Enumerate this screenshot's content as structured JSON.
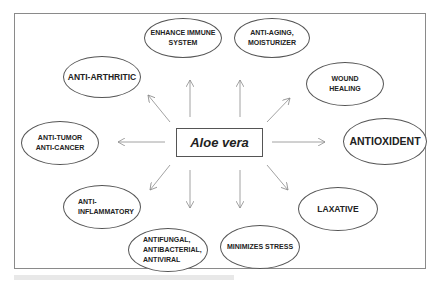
{
  "diagram": {
    "center": {
      "label": "Aloe vera"
    },
    "nodes": [
      {
        "id": "enhance-immune",
        "label": "ENHANCE IMMUNE\nSYSTEM"
      },
      {
        "id": "anti-aging",
        "label": "ANTI-AGING,\nMOISTURIZER"
      },
      {
        "id": "anti-arthritic",
        "label": "ANTI-ARTHRITIC"
      },
      {
        "id": "wound-healing",
        "label": "WOUND\nHEALING"
      },
      {
        "id": "anti-tumor",
        "label": "ANTI-TUMOR\nANTI-CANCER"
      },
      {
        "id": "antioxident",
        "label": "ANTIOXIDENT"
      },
      {
        "id": "anti-inflammatory",
        "label": "ANTI-\nINFLAMMATORY"
      },
      {
        "id": "laxative",
        "label": "LAXATIVE"
      },
      {
        "id": "antifungal",
        "label": "ANTIFUNGAL,\nANTIBACTERIAL,\nANTIVIRAL"
      },
      {
        "id": "minimizes-stress",
        "label": "MINIMIZES STRESS"
      }
    ],
    "colors": {
      "stroke": "#555555",
      "text": "#222222",
      "arrow": "#8a8a8a",
      "frame": "#8a8a8a"
    }
  }
}
